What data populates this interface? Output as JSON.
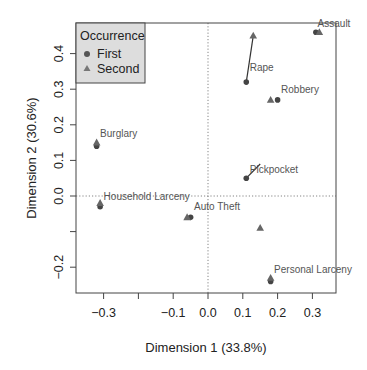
{
  "chart_data": {
    "type": "scatter",
    "title": "",
    "xlabel": "Dimension 1 (33.8%)",
    "ylabel": "Dimension 2 (30.6%)",
    "xlim": [
      -0.38,
      0.37
    ],
    "ylim": [
      -0.27,
      0.49
    ],
    "grid": false,
    "reference_lines": {
      "x": 0.0,
      "y": 0.0,
      "style": "dotted"
    },
    "x_ticks": [
      -0.3,
      -0.2,
      -0.1,
      0.0,
      0.1,
      0.2,
      0.3
    ],
    "x_tick_labels": [
      "−0.3",
      "",
      "−0.1",
      "0.0",
      "0.1",
      "0.2",
      "0.3"
    ],
    "y_ticks": [
      -0.2,
      -0.1,
      0.0,
      0.1,
      0.2,
      0.3,
      0.4
    ],
    "y_tick_labels": [
      "−0.2",
      "",
      "0.0",
      "0.1",
      "0.2",
      "0.3",
      "0.4"
    ],
    "legend": {
      "title": "Occurrence",
      "position": "top-left",
      "entries": [
        {
          "label": "First",
          "marker": "circle"
        },
        {
          "label": "Second",
          "marker": "triangle"
        }
      ]
    },
    "series": [
      {
        "name": "First",
        "marker": "circle",
        "color": "#444444",
        "points": [
          {
            "label": "Assault",
            "x": 0.31,
            "y": 0.46
          },
          {
            "label": "Rape",
            "x": 0.11,
            "y": 0.32
          },
          {
            "label": "Robbery",
            "x": 0.2,
            "y": 0.27
          },
          {
            "label": "Burglary",
            "x": -0.32,
            "y": 0.14
          },
          {
            "label": "Pickpocket",
            "x": 0.11,
            "y": 0.05
          },
          {
            "label": "Household Larceny",
            "x": -0.31,
            "y": -0.03
          },
          {
            "label": "Auto Theft",
            "x": -0.05,
            "y": -0.06
          },
          {
            "label": "Personal Larceny",
            "x": 0.18,
            "y": -0.24
          }
        ]
      },
      {
        "name": "Second",
        "marker": "triangle",
        "color": "#666666",
        "points": [
          {
            "label": "Assault",
            "x": 0.32,
            "y": 0.46
          },
          {
            "label": "Rape",
            "x": 0.13,
            "y": 0.45
          },
          {
            "label": "Robbery",
            "x": 0.18,
            "y": 0.27
          },
          {
            "label": "Burglary",
            "x": -0.32,
            "y": 0.15
          },
          {
            "label": "Pickpocket",
            "x": 0.15,
            "y": -0.09
          },
          {
            "label": "Household Larceny",
            "x": -0.31,
            "y": -0.02
          },
          {
            "label": "Auto Theft",
            "x": -0.06,
            "y": -0.06
          },
          {
            "label": "Personal Larceny",
            "x": 0.18,
            "y": -0.23
          }
        ]
      }
    ],
    "point_labels": [
      {
        "text": "Assault",
        "x": 0.315,
        "y": 0.475
      },
      {
        "text": "Rape",
        "x": 0.12,
        "y": 0.35
      },
      {
        "text": "Robbery",
        "x": 0.21,
        "y": 0.29
      },
      {
        "text": "Burglary",
        "x": -0.31,
        "y": 0.165
      },
      {
        "text": "Pickpocket",
        "x": 0.12,
        "y": 0.065
      },
      {
        "text": "Household Larceny",
        "x": -0.3,
        "y": -0.01
      },
      {
        "text": "Auto Theft",
        "x": -0.04,
        "y": -0.04
      },
      {
        "text": "Personal Larceny",
        "x": 0.19,
        "y": -0.215
      }
    ],
    "arrows": [
      {
        "label": "Rape",
        "from": [
          0.11,
          0.32
        ],
        "to": [
          0.13,
          0.45
        ]
      },
      {
        "label": "Pickpocket",
        "from": [
          0.11,
          0.05
        ],
        "to": [
          0.15,
          0.09
        ]
      }
    ]
  },
  "labels": {
    "xlabel": "Dimension 1 (33.8%)",
    "ylabel": "Dimension 2 (30.6%)",
    "legend_title": "Occurrence",
    "legend_first": "First",
    "legend_second": "Second"
  },
  "colors": {
    "point_first": "#444444",
    "point_second": "#666666",
    "text": "#333333",
    "label_text": "#555555",
    "legend_bg": "#dddddd"
  }
}
